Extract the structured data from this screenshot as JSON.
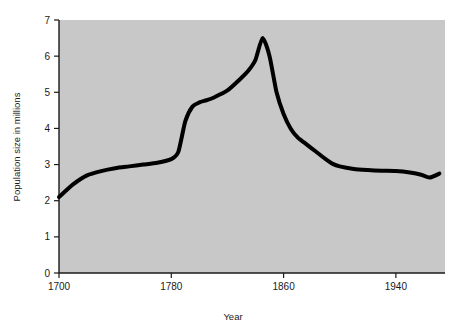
{
  "chart_data": {
    "type": "line",
    "title": "",
    "xlabel": "Year",
    "ylabel": "Population size in millions",
    "xlim": [
      1700,
      1975
    ],
    "ylim": [
      0,
      7
    ],
    "xticks": [
      1700,
      1780,
      1860,
      1940
    ],
    "xtick_labels": [
      "1700",
      "1780",
      "1860",
      "1940"
    ],
    "yticks": [
      0,
      1,
      2,
      3,
      4,
      5,
      6,
      7
    ],
    "ytick_labels": [
      "0",
      "1",
      "2",
      "3",
      "4",
      "5",
      "6",
      "7"
    ],
    "grid": false,
    "legend": false,
    "legend_position": "none",
    "plot_background_color": "#c8c8c8",
    "figure_background_color": "#ffffff",
    "line_color": "#000000",
    "line_width": 4,
    "series": [
      {
        "name": "Population size in millions",
        "x": [
          1700,
          1710,
          1720,
          1730,
          1740,
          1750,
          1760,
          1770,
          1780,
          1785,
          1790,
          1795,
          1800,
          1805,
          1810,
          1820,
          1830,
          1835,
          1840,
          1845,
          1850,
          1855,
          1860,
          1865,
          1870,
          1875,
          1880,
          1885,
          1890,
          1895,
          1900,
          1910,
          1920,
          1930,
          1940,
          1950,
          1958,
          1964,
          1971
        ],
        "y": [
          2.1,
          2.45,
          2.7,
          2.82,
          2.9,
          2.95,
          3.0,
          3.05,
          3.15,
          3.35,
          4.2,
          4.6,
          4.72,
          4.78,
          4.85,
          5.05,
          5.4,
          5.6,
          5.9,
          6.5,
          6.0,
          5.0,
          4.4,
          4.0,
          3.75,
          3.6,
          3.45,
          3.3,
          3.15,
          3.02,
          2.95,
          2.88,
          2.85,
          2.83,
          2.82,
          2.78,
          2.72,
          2.64,
          2.75
        ]
      }
    ],
    "annotations": []
  },
  "axes": {
    "y_title": "Population size in millions",
    "x_title": "Year"
  }
}
